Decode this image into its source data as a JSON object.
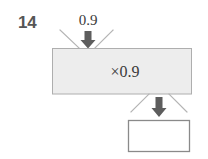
{
  "diagram": {
    "type": "function-machine",
    "question_number": "14",
    "input_value": "0.9",
    "operation_label": "×0.9",
    "output_value": "",
    "output_is_blank": true,
    "colors": {
      "background": "#ffffff",
      "machine_fill": "#ededed",
      "machine_border": "#aeaeae",
      "output_box_fill": "#ffffff",
      "output_box_border": "#8a8a8a",
      "funnel_line": "#b4b4b4",
      "arrow_fill": "#5d5d5d",
      "question_number_color": "#565656",
      "text_color": "#3a3a3a"
    },
    "icons": {
      "input_arrow": "arrow-down-icon",
      "output_arrow": "arrow-down-icon"
    }
  }
}
